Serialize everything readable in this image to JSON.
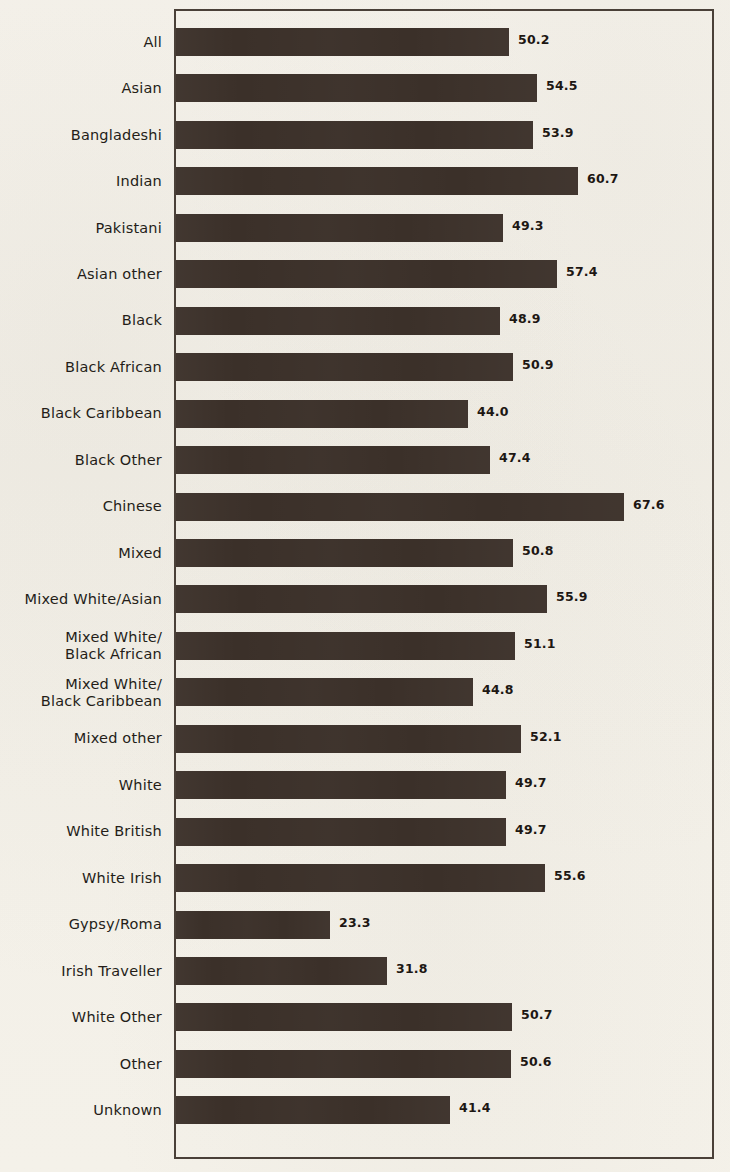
{
  "document": {
    "kind": "scanned-chart-page",
    "title_fragment": "",
    "paper_color": "#f2efe7",
    "ink_color": "#3b3029"
  },
  "chart_data": {
    "type": "bar",
    "orientation": "horizontal",
    "title": "",
    "xlabel": "",
    "ylabel": "",
    "grid": false,
    "legend": false,
    "value_labels": true,
    "xlim": [
      0,
      72
    ],
    "categories": [
      "All",
      "Asian",
      "Bangladeshi",
      "Indian",
      "Pakistani",
      "Asian other",
      "Black",
      "Black African",
      "Black Caribbean",
      "Black Other",
      "Chinese",
      "Mixed",
      "Mixed White/Asian",
      "Mixed White/\nBlack African",
      "Mixed White/\nBlack Caribbean",
      "Mixed other",
      "White",
      "White British",
      "White Irish",
      "Gypsy/Roma",
      "Irish Traveller",
      "White Other",
      "Other",
      "Unknown"
    ],
    "values": [
      50.2,
      54.5,
      53.9,
      60.7,
      49.3,
      57.4,
      48.9,
      50.9,
      44.0,
      47.4,
      67.6,
      50.8,
      55.9,
      51.1,
      44.8,
      52.1,
      49.7,
      49.7,
      55.6,
      23.3,
      31.8,
      50.7,
      50.6,
      41.4
    ],
    "value_text": [
      "50.2",
      "54.5",
      "53.9",
      "60.7",
      "49.3",
      "57.4",
      "48.9",
      "50.9",
      "44.0",
      "47.4",
      "67.6",
      "50.8",
      "55.9",
      "51.1",
      "44.8",
      "52.1",
      "49.7",
      "49.7",
      "55.6",
      "23.3",
      "31.8",
      "50.7",
      "50.6",
      "41.4"
    ]
  }
}
